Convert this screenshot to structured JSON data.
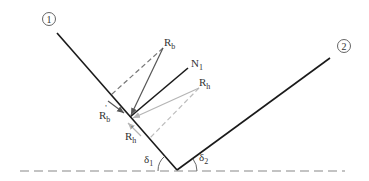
{
  "figure": {
    "surface_1_marker": "1",
    "surface_2_marker": "2",
    "labels": {
      "Rb": {
        "main": "R",
        "sub": "b",
        "prime": ""
      },
      "Rh": {
        "main": "R",
        "sub": "h",
        "prime": ""
      },
      "N1": {
        "main": "N",
        "sub": "1",
        "prime": ""
      },
      "Rb_prime": {
        "main": "R",
        "sub": "b",
        "prime": "'"
      },
      "Rh_prime": {
        "main": "R",
        "sub": "h",
        "prime": "'"
      },
      "delta1": {
        "main": "δ",
        "sub": "1"
      },
      "delta2": {
        "main": "δ",
        "sub": "2"
      }
    },
    "colors": {
      "surface_line": "#1a1a1a",
      "Rb_vector": "#555555",
      "Rh_vector": "#b5b5b5",
      "dashed_Rb": "#777777",
      "dashed_Rh": "#bdbdbd",
      "baseline": "#888888",
      "text": "#333333"
    }
  }
}
